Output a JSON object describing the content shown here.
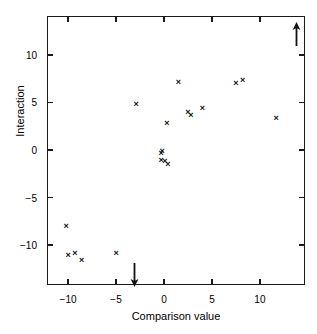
{
  "chart_data": {
    "type": "scatter",
    "title": "",
    "xlabel": "Comparison value",
    "ylabel": "Interaction",
    "xlim": [
      -12.2,
      14.7
    ],
    "ylim": [
      -14.2,
      14.1
    ],
    "xticks": [
      -10,
      -5,
      0,
      5,
      10
    ],
    "xticklabels": [
      "−10",
      "−5",
      "0",
      "5",
      "10"
    ],
    "yticks": [
      -10,
      -5,
      0,
      5,
      10
    ],
    "yticklabels": [
      "−10",
      "−5",
      "0",
      "5",
      "10"
    ],
    "grid": false,
    "legend": null,
    "marker": "x",
    "marker_color": "#111111",
    "points": [
      {
        "x": -10.2,
        "y": -8.0
      },
      {
        "x": -10.0,
        "y": -11.1
      },
      {
        "x": -9.3,
        "y": -10.9
      },
      {
        "x": -8.6,
        "y": -11.6
      },
      {
        "x": -5.0,
        "y": -10.9
      },
      {
        "x": -2.9,
        "y": 4.8
      },
      {
        "x": -0.3,
        "y": -0.4
      },
      {
        "x": -0.2,
        "y": -0.2
      },
      {
        "x": -0.3,
        "y": -1.1
      },
      {
        "x": 0.1,
        "y": -1.2
      },
      {
        "x": 0.4,
        "y": -1.5
      },
      {
        "x": 0.3,
        "y": 2.8
      },
      {
        "x": 1.5,
        "y": 7.1
      },
      {
        "x": 2.5,
        "y": 3.9
      },
      {
        "x": 2.8,
        "y": 3.6
      },
      {
        "x": 4.0,
        "y": 4.4
      },
      {
        "x": 7.5,
        "y": 7.0
      },
      {
        "x": 8.2,
        "y": 7.3
      },
      {
        "x": 11.7,
        "y": 3.3
      }
    ],
    "annotations": [
      {
        "name": "up-arrow",
        "direction": "up",
        "x": 13.8,
        "y": 12.2
      },
      {
        "name": "down-arrow",
        "direction": "down",
        "x": -3.1,
        "y": -13.2
      }
    ]
  }
}
